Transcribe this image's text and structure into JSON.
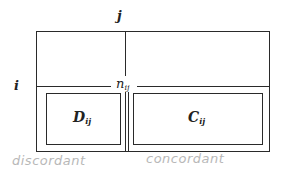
{
  "diagram": {
    "column_label": "j",
    "row_label": "i",
    "cell_label_main": "n",
    "cell_label_sub": "ij",
    "left_box_main": "D",
    "left_box_sub": "ij",
    "right_box_main": "C",
    "right_box_sub": "ij",
    "handwritten_left": "discordant",
    "handwritten_right": "concordant"
  }
}
